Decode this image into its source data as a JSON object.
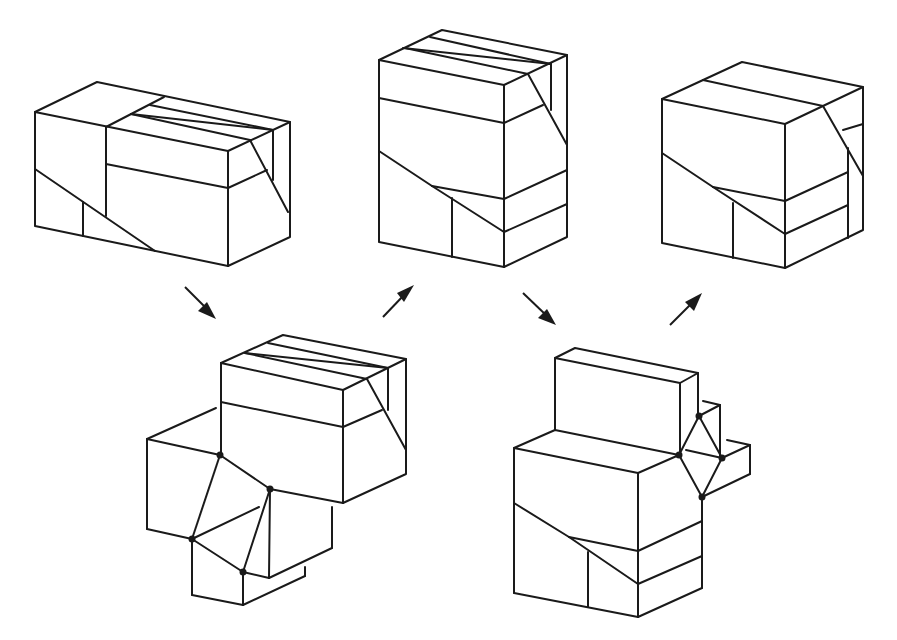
{
  "diagram": {
    "colors": {
      "line": "#1a1a1a",
      "background": "#ffffff"
    },
    "figures": [
      {
        "id": "box-1",
        "label": "",
        "position": "top-left"
      },
      {
        "id": "box-2",
        "label": "",
        "position": "top-center"
      },
      {
        "id": "box-3",
        "label": "",
        "position": "top-right"
      },
      {
        "id": "transition-1",
        "label": "",
        "position": "bottom-left"
      },
      {
        "id": "transition-2",
        "label": "",
        "position": "bottom-right"
      }
    ],
    "arrows": [
      {
        "from": "box-1",
        "to": "transition-1",
        "direction": "down-right"
      },
      {
        "from": "transition-1",
        "to": "box-2",
        "direction": "up-right"
      },
      {
        "from": "box-2",
        "to": "transition-2",
        "direction": "down-right"
      },
      {
        "from": "transition-2",
        "to": "box-3",
        "direction": "up-right"
      }
    ]
  }
}
